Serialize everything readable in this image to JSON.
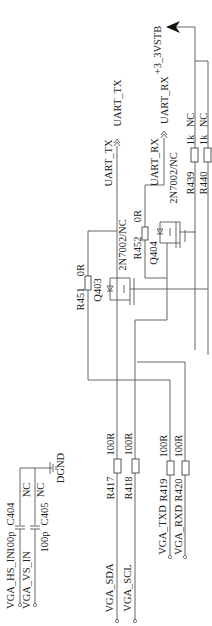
{
  "power": {
    "label": "+3_3VSTB"
  },
  "ground": {
    "label": "DGND"
  },
  "offpage": {
    "uart_tx": "UART_TX",
    "uart_rx": "UART_RX"
  },
  "nets": {
    "uart_tx": "UART_TX",
    "uart_rx": "UART_RX",
    "vga_hs_in": "VGA_HS_IN",
    "vga_vs_in": "VGA_VS_IN",
    "vga_sda": "VGA_SDA",
    "vga_scl": "VGA_SCL",
    "vga_txd": "VGA_TXD",
    "vga_rxd": "VGA_RXD"
  },
  "components": {
    "R439": {
      "ref": "R439",
      "value": "1k",
      "note": "NC"
    },
    "R440": {
      "ref": "R440",
      "value": "1k",
      "note": "NC"
    },
    "R451": {
      "ref": "R451",
      "value": "0R"
    },
    "R452": {
      "ref": "R452",
      "value": "0R"
    },
    "Q403": {
      "ref": "Q403",
      "part": "2N7002/NC"
    },
    "Q404": {
      "ref": "Q404",
      "part": "2N7002/NC"
    },
    "C404": {
      "ref": "C404",
      "value": "100p",
      "note": "NC"
    },
    "C405": {
      "ref": "C405",
      "value": "100p",
      "note": "NC"
    },
    "R417": {
      "ref": "R417",
      "value": "100R"
    },
    "R418": {
      "ref": "R418",
      "value": "100R"
    },
    "R419": {
      "ref": "R419",
      "value": "100R"
    },
    "R420": {
      "ref": "R420",
      "value": "100R"
    }
  }
}
